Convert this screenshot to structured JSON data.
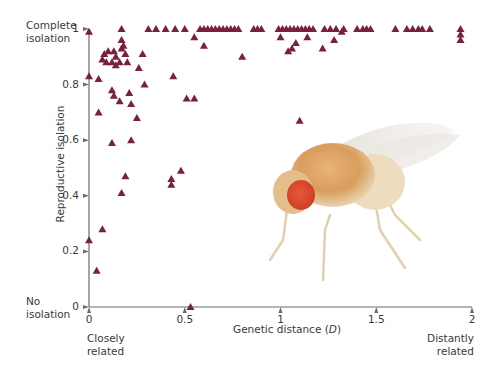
{
  "chart_data": {
    "type": "scatter",
    "title": "",
    "xlabel": "Genetic distance (D)",
    "ylabel": "Reproductive isolation",
    "xlim": [
      0,
      2
    ],
    "ylim": [
      0,
      1
    ],
    "x_ticks": [
      "0",
      "0.5",
      "1",
      "1.5",
      "2"
    ],
    "y_ticks": [
      "0",
      "0.2",
      "0.4",
      "0.6",
      "0.8",
      "1"
    ],
    "grid": false,
    "legend": null,
    "marker": "triangle",
    "marker_color": "#7a1f3d",
    "annotations": {
      "y_top": [
        "Complete",
        "isolation"
      ],
      "y_bottom": [
        "No",
        "isolation"
      ],
      "x_left": [
        "Closely",
        "related"
      ],
      "x_right": [
        "Distantly",
        "related"
      ]
    },
    "series": [
      {
        "name": "Drosophila species pairs",
        "points": [
          [
            0.0,
            0.99
          ],
          [
            0.0,
            0.83
          ],
          [
            0.05,
            0.82
          ],
          [
            0.0,
            0.24
          ],
          [
            0.04,
            0.13
          ],
          [
            0.07,
            0.28
          ],
          [
            0.05,
            0.7
          ],
          [
            0.07,
            0.89
          ],
          [
            0.08,
            0.91
          ],
          [
            0.1,
            0.92
          ],
          [
            0.09,
            0.88
          ],
          [
            0.12,
            0.88
          ],
          [
            0.13,
            0.92
          ],
          [
            0.14,
            0.9
          ],
          [
            0.14,
            0.87
          ],
          [
            0.16,
            0.88
          ],
          [
            0.17,
            0.93
          ],
          [
            0.17,
            0.96
          ],
          [
            0.18,
            0.94
          ],
          [
            0.19,
            0.91
          ],
          [
            0.2,
            0.88
          ],
          [
            0.12,
            0.78
          ],
          [
            0.13,
            0.76
          ],
          [
            0.16,
            0.74
          ],
          [
            0.21,
            0.77
          ],
          [
            0.22,
            0.73
          ],
          [
            0.12,
            0.59
          ],
          [
            0.17,
            0.41
          ],
          [
            0.19,
            0.47
          ],
          [
            0.22,
            0.6
          ],
          [
            0.25,
            0.68
          ],
          [
            0.17,
            1.0
          ],
          [
            0.26,
            0.86
          ],
          [
            0.28,
            0.91
          ],
          [
            0.29,
            0.8
          ],
          [
            0.31,
            1.0
          ],
          [
            0.35,
            1.0
          ],
          [
            0.4,
            1.0
          ],
          [
            0.44,
            0.83
          ],
          [
            0.43,
            0.46
          ],
          [
            0.43,
            0.44
          ],
          [
            0.48,
            0.49
          ],
          [
            0.51,
            0.75
          ],
          [
            0.55,
            0.75
          ],
          [
            0.53,
            0.0
          ],
          [
            0.45,
            1.0
          ],
          [
            0.5,
            1.0
          ],
          [
            0.55,
            0.97
          ],
          [
            0.58,
            1.0
          ],
          [
            0.6,
            1.0
          ],
          [
            0.6,
            0.94
          ],
          [
            0.62,
            1.0
          ],
          [
            0.64,
            1.0
          ],
          [
            0.66,
            1.0
          ],
          [
            0.68,
            1.0
          ],
          [
            0.7,
            1.0
          ],
          [
            0.72,
            1.0
          ],
          [
            0.74,
            1.0
          ],
          [
            0.76,
            1.0
          ],
          [
            0.78,
            1.0
          ],
          [
            0.8,
            0.9
          ],
          [
            0.86,
            1.0
          ],
          [
            0.88,
            1.0
          ],
          [
            0.9,
            1.0
          ],
          [
            0.99,
            1.0
          ],
          [
            1.01,
            1.0
          ],
          [
            1.03,
            1.0
          ],
          [
            1.05,
            1.0
          ],
          [
            1.07,
            1.0
          ],
          [
            1.09,
            1.0
          ],
          [
            1.11,
            1.0
          ],
          [
            1.13,
            1.0
          ],
          [
            1.15,
            1.0
          ],
          [
            1.17,
            1.0
          ],
          [
            1.0,
            0.97
          ],
          [
            1.04,
            0.92
          ],
          [
            1.06,
            0.93
          ],
          [
            1.08,
            0.95
          ],
          [
            1.1,
            0.67
          ],
          [
            1.14,
            0.97
          ],
          [
            1.22,
            0.93
          ],
          [
            1.28,
            0.96
          ],
          [
            1.32,
            0.99
          ],
          [
            1.23,
            1.0
          ],
          [
            1.26,
            1.0
          ],
          [
            1.29,
            1.0
          ],
          [
            1.33,
            1.0
          ],
          [
            1.4,
            1.0
          ],
          [
            1.43,
            1.0
          ],
          [
            1.45,
            1.0
          ],
          [
            1.47,
            1.0
          ],
          [
            1.6,
            1.0
          ],
          [
            1.66,
            1.0
          ],
          [
            1.69,
            1.0
          ],
          [
            1.72,
            1.0
          ],
          [
            1.74,
            1.0
          ],
          [
            1.78,
            1.0
          ],
          [
            1.94,
            1.0
          ],
          [
            1.94,
            0.98
          ],
          [
            1.94,
            0.96
          ]
        ]
      }
    ],
    "image_inset": "fruit fly (Drosophila) photograph"
  }
}
